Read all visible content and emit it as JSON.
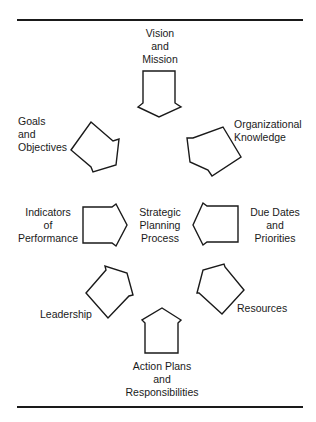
{
  "diagram": {
    "center": {
      "label": "Strategic\nPlanning\nProcess"
    },
    "nodes": [
      {
        "id": "vision",
        "label": "Vision\nand\nMission",
        "arrow_direction": "down"
      },
      {
        "id": "org",
        "label": "Organizational\nKnowledge",
        "arrow_direction": "down-left"
      },
      {
        "id": "due",
        "label": "Due Dates\nand\nPriorities",
        "arrow_direction": "left"
      },
      {
        "id": "resources",
        "label": "Resources",
        "arrow_direction": "up-left"
      },
      {
        "id": "action",
        "label": "Action Plans\nand\nResponsibilities",
        "arrow_direction": "up"
      },
      {
        "id": "leadership",
        "label": "Leadership",
        "arrow_direction": "up-right"
      },
      {
        "id": "indicators",
        "label": "Indicators\nof\nPerformance",
        "arrow_direction": "right"
      },
      {
        "id": "goals",
        "label": "Goals\nand\nObjectives",
        "arrow_direction": "down-right"
      }
    ]
  },
  "colors": {
    "ink": "#1a1a1a",
    "background": "#ffffff"
  }
}
